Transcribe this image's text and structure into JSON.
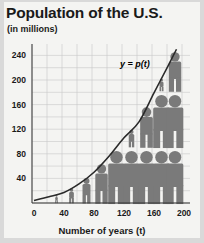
{
  "title": "Population of the U.S.",
  "subtitle": "(in millions)",
  "xlabel": "Number of years (t)",
  "curve_label": "y = p(t)",
  "colors": {
    "background": "#f4f4f2",
    "grid": "#c8c8c8",
    "axis": "#333333",
    "curve": "#2a2a2a",
    "figures": "#7a7a7a",
    "text": "#1a1a1a"
  },
  "chart_data": {
    "type": "line",
    "title": "Population of the U.S.",
    "subtitle": "(in millions)",
    "xlabel": "Number of years (t)",
    "ylabel": "",
    "series": [
      {
        "name": "y = p(t)",
        "x": [
          0,
          20,
          40,
          60,
          80,
          100,
          120,
          140,
          160,
          180,
          190
        ],
        "values": [
          4,
          10,
          17,
          31,
          50,
          76,
          106,
          132,
          179,
          226,
          250
        ]
      }
    ],
    "xticks": [
      0,
      40,
      80,
      120,
      160,
      200
    ],
    "yticks": [
      40,
      80,
      120,
      160,
      200,
      240
    ],
    "xlim": [
      0,
      200
    ],
    "ylim": [
      0,
      250
    ],
    "grid": true,
    "legend": "none",
    "annotations": [
      "y = p(t)"
    ],
    "decoration": "pictograph of people silhouettes under the curve"
  }
}
